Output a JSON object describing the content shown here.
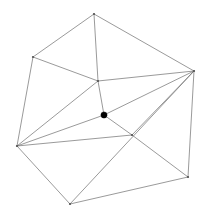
{
  "figure": {
    "type": "node-link-diagram",
    "canvas": {
      "width": 209,
      "height": 213,
      "background": "#ffffff"
    },
    "style": {
      "edge_color": "#6e6e6e",
      "edge_width": 0.7,
      "vertex_color": "#555555",
      "marked_vertex_color": "#000000",
      "marked_vertex_radius": 3.1,
      "plain_vertex_radius": 1.1
    },
    "nodes": [
      {
        "id": "apex",
        "label": "",
        "x": 94,
        "y": 14,
        "marked": false,
        "degree": 3
      },
      {
        "id": "upper-left",
        "label": "",
        "x": 33,
        "y": 57,
        "marked": false,
        "degree": 3
      },
      {
        "id": "right",
        "label": "",
        "x": 194,
        "y": 71,
        "marked": false,
        "degree": 6
      },
      {
        "id": "interior-up",
        "label": "",
        "x": 98,
        "y": 81,
        "marked": false,
        "degree": 5
      },
      {
        "id": "marked-dot",
        "label": "",
        "x": 104,
        "y": 115,
        "marked": true,
        "degree": 4
      },
      {
        "id": "mid-right",
        "label": "",
        "x": 132,
        "y": 135,
        "marked": false,
        "degree": 5
      },
      {
        "id": "bottom-left",
        "label": "",
        "x": 17,
        "y": 146,
        "marked": false,
        "degree": 5
      },
      {
        "id": "bottom-right",
        "label": "",
        "x": 188,
        "y": 177,
        "marked": false,
        "degree": 3
      },
      {
        "id": "bottom",
        "label": "",
        "x": 70,
        "y": 204,
        "marked": false,
        "degree": 3
      }
    ],
    "edges": [
      {
        "source": "apex",
        "target": "upper-left"
      },
      {
        "source": "apex",
        "target": "right"
      },
      {
        "source": "apex",
        "target": "interior-up"
      },
      {
        "source": "upper-left",
        "target": "interior-up"
      },
      {
        "source": "upper-left",
        "target": "bottom-left"
      },
      {
        "source": "interior-up",
        "target": "right"
      },
      {
        "source": "interior-up",
        "target": "marked-dot"
      },
      {
        "source": "interior-up",
        "target": "bottom-left"
      },
      {
        "source": "right",
        "target": "marked-dot"
      },
      {
        "source": "right",
        "target": "mid-right"
      },
      {
        "source": "right",
        "target": "bottom-right"
      },
      {
        "source": "right",
        "target": "bottom"
      },
      {
        "source": "marked-dot",
        "target": "bottom-left"
      },
      {
        "source": "marked-dot",
        "target": "mid-right"
      },
      {
        "source": "bottom-left",
        "target": "mid-right"
      },
      {
        "source": "bottom-left",
        "target": "bottom"
      },
      {
        "source": "mid-right",
        "target": "bottom-right"
      },
      {
        "source": "bottom",
        "target": "bottom-right"
      }
    ]
  }
}
